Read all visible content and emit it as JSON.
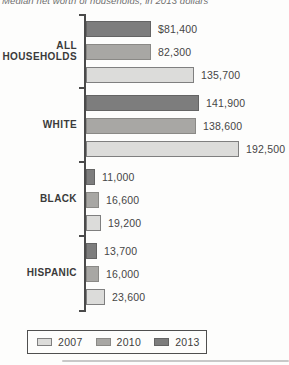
{
  "title": "Median net worth of households, in 2013 dollars",
  "chart_data": {
    "type": "bar",
    "orientation": "horizontal",
    "title": "Median net worth of households, in 2013 dollars",
    "categories": [
      "ALL HOUSEHOLDS",
      "WHITE",
      "BLACK",
      "HISPANIC"
    ],
    "series": [
      {
        "name": "2013",
        "fill": "#7d7d7d",
        "border": "#646464",
        "values": [
          81400,
          141900,
          11000,
          13700
        ],
        "value_labels": [
          "$81,400",
          "141,900",
          "11,000",
          "13,700"
        ]
      },
      {
        "name": "2010",
        "fill": "#a8a7a4",
        "border": "#8a8986",
        "values": [
          82300,
          138600,
          16600,
          16000
        ],
        "value_labels": [
          "82,300",
          "138,600",
          "16,600",
          "16,000"
        ]
      },
      {
        "name": "2007",
        "fill": "#dcdcda",
        "border": "#7f7f7f",
        "values": [
          135700,
          192500,
          19200,
          23600
        ],
        "value_labels": [
          "135,700",
          "192,500",
          "19,200",
          "23,600"
        ]
      }
    ],
    "bar_order_top_to_bottom": [
      "2013",
      "2010",
      "2007"
    ],
    "legend": {
      "position": "bottom",
      "entries": [
        {
          "label": "2007",
          "fill": "#dcdcda",
          "border": "#7f7f7f"
        },
        {
          "label": "2010",
          "fill": "#a8a7a4",
          "border": "#8a8986"
        },
        {
          "label": "2013",
          "fill": "#7d7d7d",
          "border": "#646464"
        }
      ]
    },
    "xlim": [
      0,
      192500
    ],
    "grid": false
  },
  "colors": {
    "axis": "#4a4a4a",
    "category_text": "#3a3a3a",
    "value_text": "#464646",
    "title_text": "#6f6f6f",
    "separator": "#c8c8c8"
  }
}
